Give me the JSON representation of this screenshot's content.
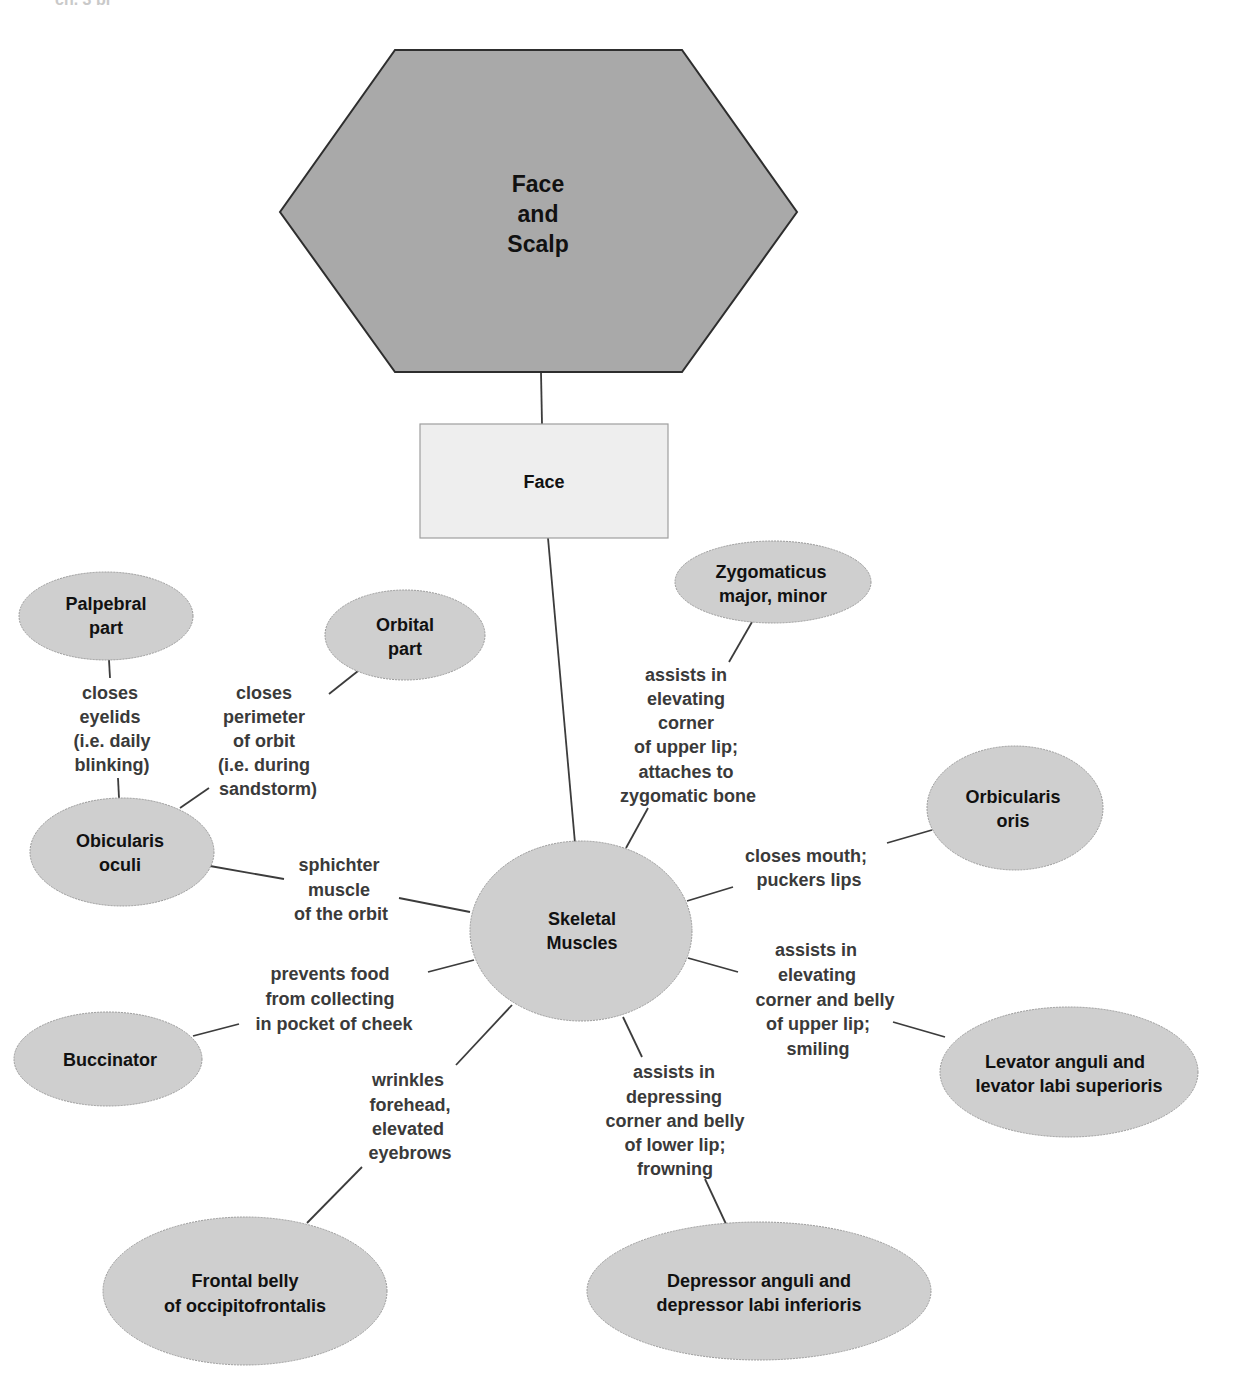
{
  "header_fragment": "ch. 3 bl",
  "colors": {
    "hexagon_fill": "#a9a9a9",
    "box_fill": "#eeeeee",
    "ellipse_fill": "#cfcfcf",
    "edge": "#3c3c3c",
    "node_text": "#111111",
    "label_text": "#3a3a3a"
  },
  "root": {
    "lines": [
      "Face",
      "and",
      "Scalp"
    ]
  },
  "face_box": {
    "label": "Face"
  },
  "hub": {
    "lines": [
      "Skeletal",
      "Muscles"
    ]
  },
  "nodes": {
    "palpebral": {
      "lines": [
        "Palpebral",
        "part"
      ]
    },
    "orbital": {
      "lines": [
        "Orbital",
        "part"
      ]
    },
    "obicularis_oculi": {
      "lines": [
        "Obicularis",
        "oculi"
      ]
    },
    "buccinator": {
      "lines": [
        "Buccinator"
      ]
    },
    "frontal_belly": {
      "lines": [
        "Frontal belly",
        "of occipitofrontalis"
      ]
    },
    "zygomaticus": {
      "lines": [
        "Zygomaticus",
        "major, minor"
      ]
    },
    "orbicularis_oris": {
      "lines": [
        "Orbicularis",
        "oris"
      ]
    },
    "levator": {
      "lines": [
        "Levator anguli and",
        "levator labi superioris"
      ]
    },
    "depressor": {
      "lines": [
        "Depressor anguli and",
        "depressor labi inferioris"
      ]
    }
  },
  "labels": {
    "palpebral": {
      "lines": [
        "closes",
        "eyelids",
        "(i.e. daily",
        "blinking)"
      ]
    },
    "orbital": {
      "lines": [
        "closes",
        "perimeter",
        "of orbit",
        "(i.e. during",
        "sandstorm)"
      ]
    },
    "oculi": {
      "lines": [
        "sphichter",
        "muscle",
        "of the orbit"
      ]
    },
    "buccinator": {
      "lines": [
        "prevents food",
        "from collecting",
        "in pocket of cheek"
      ]
    },
    "frontal": {
      "lines": [
        "wrinkles",
        "forehead,",
        "elevated",
        "eyebrows"
      ]
    },
    "zygomaticus": {
      "lines": [
        "assists in",
        "elevating",
        "corner",
        "of upper lip;",
        "attaches to",
        "zygomatic bone"
      ]
    },
    "oris": {
      "lines": [
        "closes mouth;",
        "puckers lips"
      ]
    },
    "levator": {
      "lines": [
        "assists in",
        "elevating",
        "corner and belly",
        "of upper lip;",
        "smiling"
      ]
    },
    "depressor": {
      "lines": [
        "assists in",
        "depressing",
        "corner and belly",
        "of lower lip;",
        "frowning"
      ]
    }
  }
}
